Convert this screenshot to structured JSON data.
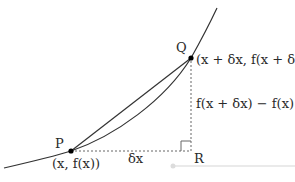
{
  "diagram": {
    "points": {
      "P": {
        "label": "P",
        "coords": "(x, f(x))"
      },
      "Q": {
        "label": "Q",
        "coords": "(x + δx, f(x + δx))"
      },
      "R": {
        "label": "R"
      }
    },
    "labels": {
      "dx": "δx",
      "dy": "f(x + δx) − f(x)"
    },
    "colors": {
      "curve": "#333333",
      "dashed": "#666666",
      "slider": "#d9d9d9"
    }
  }
}
